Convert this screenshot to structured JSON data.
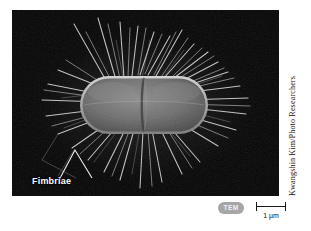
{
  "figure": {
    "kind": "scanning-electron-micrograph",
    "plate_background_color": "#050505",
    "page_background_color": "#ffffff"
  },
  "annotations": {
    "fimbriae_label": "Fimbriae",
    "fimbriae_label_color": "#ffffff"
  },
  "credit": {
    "text": "Kwangshin Kim/Photo Researchers",
    "color": "#111111"
  },
  "caption": {
    "technique_badge": "TEM",
    "technique_badge_color": "#a6a6a6",
    "scale_bar_label": "1 µm",
    "scale_bar_color": "#1a1a1a"
  },
  "micrograph_detail": {
    "cell_body_fill": "#6e6e6e",
    "cell_body_rim": "#b9b9b9",
    "fimbriae_color": "#d8d8d8",
    "cell_center_x": 132,
    "cell_center_y": 95,
    "cell_width": 128,
    "cell_height": 58
  }
}
